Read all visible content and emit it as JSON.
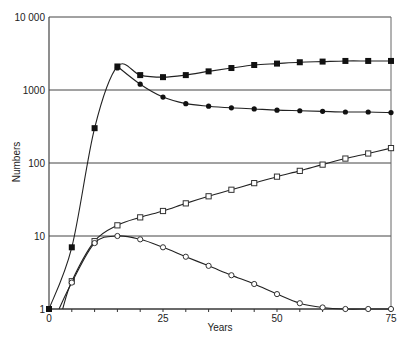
{
  "chart_data": {
    "type": "line",
    "title": "",
    "xlabel": "Years",
    "ylabel": "Numbers",
    "xlim": [
      0,
      75
    ],
    "ylim": [
      1,
      10000
    ],
    "yscale": "log",
    "grid": "horizontal at decades",
    "legend": "none",
    "x_ticks": [
      0,
      25,
      50,
      75
    ],
    "x_tick_labels": [
      "0",
      "25",
      "50",
      "75"
    ],
    "x_minor_tick_step": 5,
    "y_ticks": [
      1,
      10,
      100,
      1000,
      10000
    ],
    "y_tick_labels": [
      "1",
      "10",
      "100",
      "1000",
      "10 000"
    ],
    "x": [
      0,
      5,
      10,
      15,
      20,
      25,
      30,
      35,
      40,
      45,
      50,
      55,
      60,
      65,
      70,
      75
    ],
    "series": [
      {
        "name": "filled-square",
        "marker": "filled-square",
        "points": [
          [
            0,
            1
          ],
          [
            5,
            7
          ],
          [
            10,
            300
          ],
          [
            15,
            2100
          ],
          [
            20,
            1600
          ],
          [
            25,
            1500
          ],
          [
            30,
            1600
          ],
          [
            35,
            1800
          ],
          [
            40,
            2000
          ],
          [
            45,
            2200
          ],
          [
            50,
            2300
          ],
          [
            55,
            2400
          ],
          [
            60,
            2450
          ],
          [
            65,
            2500
          ],
          [
            70,
            2500
          ],
          [
            75,
            2500
          ]
        ]
      },
      {
        "name": "filled-circle",
        "marker": "filled-circle",
        "points": [
          [
            15,
            2000
          ],
          [
            20,
            1200
          ],
          [
            25,
            800
          ],
          [
            30,
            650
          ],
          [
            35,
            600
          ],
          [
            40,
            570
          ],
          [
            45,
            550
          ],
          [
            50,
            530
          ],
          [
            55,
            520
          ],
          [
            60,
            510
          ],
          [
            65,
            500
          ],
          [
            70,
            500
          ],
          [
            75,
            490
          ]
        ]
      },
      {
        "name": "open-square",
        "marker": "open-square",
        "points": [
          [
            5,
            2.4
          ],
          [
            10,
            8.5
          ],
          [
            15,
            14
          ],
          [
            20,
            18
          ],
          [
            25,
            22
          ],
          [
            30,
            28
          ],
          [
            35,
            35
          ],
          [
            40,
            43
          ],
          [
            45,
            53
          ],
          [
            50,
            65
          ],
          [
            55,
            78
          ],
          [
            60,
            95
          ],
          [
            65,
            115
          ],
          [
            70,
            135
          ],
          [
            75,
            160
          ]
        ]
      },
      {
        "name": "open-circle",
        "marker": "open-circle",
        "points": [
          [
            5,
            2.3
          ],
          [
            10,
            8
          ],
          [
            15,
            10
          ],
          [
            20,
            9
          ],
          [
            25,
            7
          ],
          [
            30,
            5.2
          ],
          [
            35,
            3.9
          ],
          [
            40,
            2.9
          ],
          [
            45,
            2.2
          ],
          [
            50,
            1.6
          ],
          [
            55,
            1.2
          ],
          [
            60,
            1.05
          ],
          [
            65,
            1
          ],
          [
            70,
            1
          ],
          [
            75,
            1
          ]
        ]
      }
    ]
  },
  "labels": {
    "xlabel": "Years",
    "ylabel": "Numbers"
  }
}
